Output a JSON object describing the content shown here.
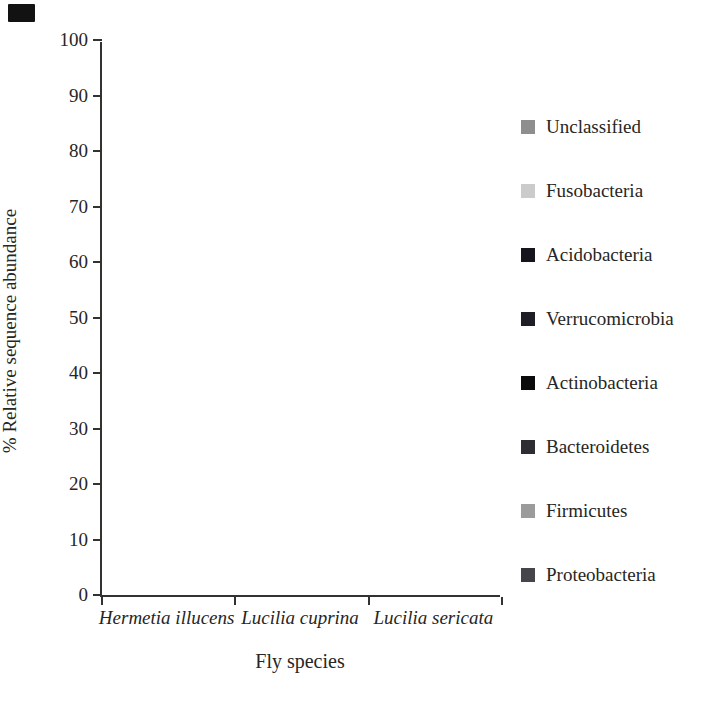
{
  "figure": {
    "background": "#ffffff",
    "axis_color": "#32322f",
    "text_color": "#262624"
  },
  "chart_data": {
    "type": "bar",
    "subtype": "stacked-percent",
    "title": "",
    "xlabel": "Fly species",
    "ylabel": "% Relative sequence abundance",
    "ylim": [
      0,
      100
    ],
    "yticks": [
      0,
      10,
      20,
      30,
      40,
      50,
      60,
      70,
      80,
      90,
      100
    ],
    "grid": false,
    "legend_position": "right",
    "legend_order_top_to_bottom": [
      "Unclassified",
      "Fusobacteria",
      "Acidobacteria",
      "Verrucomicrobia",
      "Actinobacteria",
      "Bacteroidetes",
      "Firmicutes",
      "Proteobacteria"
    ],
    "categories": [
      "Hermetia illucens",
      "Lucilia cuprina",
      "Lucilia sericata"
    ],
    "series": [
      {
        "name": "Proteobacteria",
        "color": "#45454b",
        "values": [
          33.5,
          43.0,
          84.0
        ]
      },
      {
        "name": "Firmicutes",
        "color": "#9b9b9b",
        "values": [
          11.0,
          51.0,
          11.0
        ]
      },
      {
        "name": "Bacteroidetes",
        "color": "#2d2d33",
        "values": [
          42.0,
          5.0,
          4.0
        ]
      },
      {
        "name": "Actinobacteria",
        "color": "#0b0b0d",
        "values": [
          12.5,
          0.2,
          0.2
        ]
      },
      {
        "name": "Verrucomicrobia",
        "color": "#1e1e26",
        "values": [
          0.2,
          0.1,
          0.1
        ]
      },
      {
        "name": "Acidobacteria",
        "color": "#15151d",
        "values": [
          0.2,
          0.1,
          0.1
        ]
      },
      {
        "name": "Fusobacteria",
        "color": "#cbcbcb",
        "values": [
          0.1,
          0.4,
          0.1
        ]
      },
      {
        "name": "Unclassified",
        "color": "#8e8e8e",
        "values": [
          0.5,
          0.2,
          0.5
        ]
      }
    ]
  }
}
